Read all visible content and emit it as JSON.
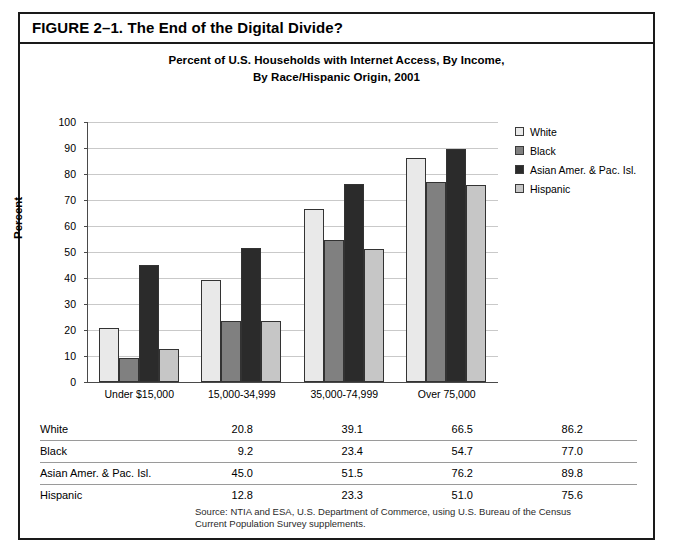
{
  "figure": {
    "title": "FIGURE 2–1. The End of the Digital Divide?",
    "subtitle_line1": "Percent of U.S. Households with Internet Access, By Income,",
    "subtitle_line2": "By Race/Hispanic Origin, 2001"
  },
  "chart_data": {
    "type": "bar",
    "title": "Percent of U.S. Households with Internet Access, By Income, By Race/Hispanic Origin, 2001",
    "xlabel": "",
    "ylabel": "Percent",
    "ylim": [
      0,
      100
    ],
    "ytick_step": 10,
    "yticks": [
      "0",
      "10",
      "20",
      "30",
      "40",
      "50",
      "60",
      "70",
      "80",
      "90",
      "100"
    ],
    "grid": true,
    "legend_position": "right",
    "categories": [
      "Under $15,000",
      "15,000-34,999",
      "35,000-74,999",
      "Over 75,000"
    ],
    "series": [
      {
        "name": "White",
        "color": "#e9e9e9",
        "values": [
          20.8,
          39.1,
          66.5,
          86.2
        ]
      },
      {
        "name": "Black",
        "color": "#808080",
        "values": [
          9.2,
          23.4,
          54.7,
          77.0
        ]
      },
      {
        "name": "Asian Amer. & Pac. Isl.",
        "color": "#2b2b2b",
        "values": [
          45.0,
          51.5,
          76.2,
          89.8
        ]
      },
      {
        "name": "Hispanic",
        "color": "#c6c6c6",
        "values": [
          12.8,
          23.3,
          51.0,
          75.6
        ]
      }
    ]
  },
  "table": {
    "rows": [
      {
        "label": "White",
        "values": [
          "20.8",
          "39.1",
          "66.5",
          "86.2"
        ]
      },
      {
        "label": "Black",
        "values": [
          "9.2",
          "23.4",
          "54.7",
          "77.0"
        ]
      },
      {
        "label": "Asian Amer. & Pac. Isl.",
        "values": [
          "45.0",
          "51.5",
          "76.2",
          "89.8"
        ]
      },
      {
        "label": "Hispanic",
        "values": [
          "12.8",
          "23.3",
          "51.0",
          "75.6"
        ]
      }
    ]
  },
  "source": {
    "line1": "Source: NTIA and ESA, U.S. Department of Commerce, using U.S. Bureau of the Census",
    "line2": "Current Population Survey supplements."
  }
}
